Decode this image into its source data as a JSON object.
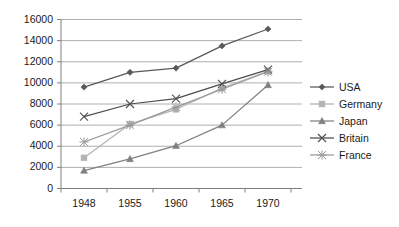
{
  "chart_data": {
    "type": "line",
    "title": "",
    "xlabel": "",
    "ylabel": "",
    "categories": [
      "1948",
      "1955",
      "1960",
      "1965",
      "1970"
    ],
    "ylim": [
      0,
      16000
    ],
    "ytick_labels": [
      "0",
      "2000",
      "4000",
      "6000",
      "8000",
      "10000",
      "12000",
      "14000",
      "16000"
    ],
    "ytick_values": [
      0,
      2000,
      4000,
      6000,
      8000,
      10000,
      12000,
      14000,
      16000
    ],
    "grid": "horizontal",
    "legend_position": "right",
    "series": [
      {
        "name": "USA",
        "marker": "diamond",
        "color": "#595959",
        "values": [
          9600,
          11000,
          11400,
          13500,
          15100
        ]
      },
      {
        "name": "Germany",
        "marker": "square",
        "color": "#b3b3b3",
        "values": [
          2900,
          6100,
          7500,
          9500,
          11100
        ]
      },
      {
        "name": "Japan",
        "marker": "triangle",
        "color": "#808080",
        "values": [
          1700,
          2800,
          4050,
          6000,
          9800
        ]
      },
      {
        "name": "Britain",
        "marker": "cross",
        "color": "#4d4d4d",
        "values": [
          6800,
          8000,
          8500,
          9900,
          11250
        ]
      },
      {
        "name": "France",
        "marker": "asterisk",
        "color": "#999999",
        "values": [
          4400,
          6000,
          7700,
          9400,
          11050
        ]
      }
    ]
  },
  "axes": {
    "axis_color": "#808080",
    "grid_color": "#a6a6a6",
    "text_color": "#1a1a1a"
  }
}
